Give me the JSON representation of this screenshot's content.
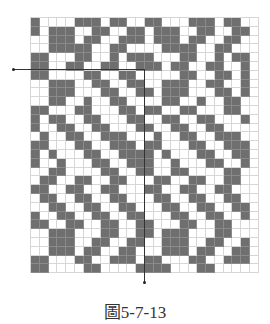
{
  "figure": {
    "caption": "圖5-7-13",
    "colors": {
      "filled": "#6f6f6f",
      "empty": "#ffffff",
      "gridline": "#d6d6d6",
      "arrow": "#333333"
    },
    "grid": {
      "cols": 26,
      "rows": 29,
      "cell_w": 8.75,
      "cell_h": 8.8,
      "pattern": [
        "1000011101100110001110110 ",
        "1011100110011011100110011 ",
        "0011101100111011101100110 ",
        "0011111001100001111001100 ",
        "1100011001011100011001011",
        "1100110011001110110011001",
        "1100001100110000011001101",
        "0011100110011001110011001",
        "0011100011001101110001101",
        "0011001001100001100100110",
        "1100011000110110011000110",
        "1011001100011001100110001",
        "1001100110001100110011000",
        "0100110011100010011001110",
        "1100011001110110001100111",
        "1010001100111101000110011",
        "1001000110011100100011001",
        "0011000011001100110000110",
        "0110011001100011001100110",
        "1100110011000110011001100",
        "0110011001100011001100110",
        "0011001100110001100110011",
        "1001100110011000110011001",
        "1100110011001100011001100",
        "0011100011001101110001100",
        "0011100110011001110011001",
        "0011101100110001110110011",
        "1100011001110110001100111",
        "1100001100001111000110000"
      ]
    },
    "arrows": [
      {
        "name": "horizontal-arrow",
        "from": [
          13,
          69
        ],
        "to": [
          144,
          69
        ]
      },
      {
        "name": "vertical-arrow",
        "from": [
          144,
          69
        ],
        "to": [
          144,
          282
        ]
      }
    ]
  }
}
